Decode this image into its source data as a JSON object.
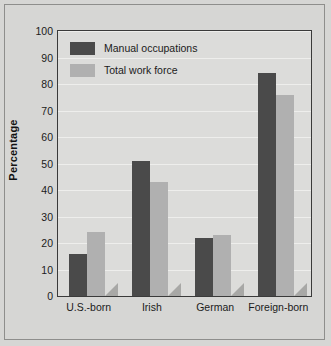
{
  "chart_data": {
    "type": "bar",
    "title": "",
    "subtitle": "",
    "xlabel": "",
    "ylabel": "Percentage",
    "categories": [
      "U.S.-born",
      "Irish",
      "German",
      "Foreign-born"
    ],
    "series": [
      {
        "name": "Manual occupations",
        "color": "#4a4a4a",
        "values": [
          16,
          51,
          22,
          84
        ]
      },
      {
        "name": "Total work force",
        "color": "#b0b0b0",
        "values": [
          24,
          43,
          23,
          76
        ]
      }
    ],
    "ylim": [
      0,
      100
    ],
    "ytick_step": 10,
    "yticks": [
      0,
      10,
      20,
      30,
      40,
      50,
      60,
      70,
      80,
      90,
      100
    ],
    "ytick_labels": [
      "0",
      "10",
      "20",
      "30",
      "40",
      "50",
      "60",
      "70",
      "80",
      "90",
      "100"
    ],
    "grid": true,
    "grid_axis": "y",
    "legend_position": "top-left",
    "annotations": []
  },
  "colors": {
    "page_background": "#d6d6d4",
    "plot_background": "#dcdcda",
    "gridline": "#eeeeec",
    "frame": "#3a3a3a",
    "text": "#1b1b1b",
    "bar_shadow": "#a8a8a6"
  },
  "legend": {
    "items": [
      {
        "label": "Manual occupations",
        "color": "#4a4a4a"
      },
      {
        "label": "Total work force",
        "color": "#b0b0b0"
      }
    ]
  },
  "axes": {
    "y": {
      "title": "Percentage",
      "ticks": [
        "100",
        "90",
        "80",
        "70",
        "60",
        "50",
        "40",
        "30",
        "20",
        "10",
        "0"
      ]
    },
    "x": {
      "ticks": [
        "U.S.-born",
        "Irish",
        "German",
        "Foreign-born"
      ]
    }
  }
}
